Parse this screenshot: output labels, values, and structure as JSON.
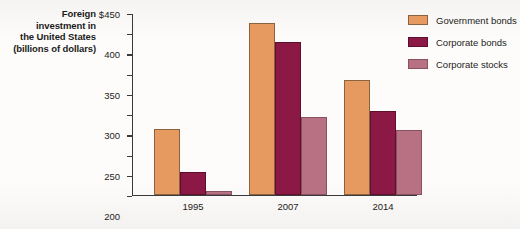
{
  "chart_data": {
    "type": "bar",
    "title": "Foreign investment in the United States (billions of dollars)",
    "title_lines": [
      "Foreign",
      "investment in",
      "the United States",
      "(billions of dollars)"
    ],
    "xlabel": "",
    "ylabel": "Foreign investment in the United States (billions of dollars)",
    "categories": [
      "1995",
      "2007",
      "2014"
    ],
    "series": [
      {
        "name": "Government bonds",
        "values": [
          163,
          425,
          283
        ],
        "color": "#e79a5f"
      },
      {
        "name": "Corporate bonds",
        "values": [
          57,
          378,
          207
        ],
        "color": "#8c1845"
      },
      {
        "name": "Corporate stocks",
        "values": [
          10,
          192,
          160
        ],
        "color": "#b87183"
      }
    ],
    "ylim": [
      0,
      450
    ],
    "ytick_values": [
      0,
      50,
      100,
      150,
      200,
      250,
      300,
      350,
      400,
      450
    ],
    "ytick_labels": [
      "0",
      "50",
      "100",
      "150",
      "200",
      "250",
      "300",
      "350",
      "400",
      "$450"
    ],
    "grid": false,
    "legend_position": "right"
  },
  "legend": {
    "items": [
      {
        "label": "Government bonds"
      },
      {
        "label": "Corporate bonds"
      },
      {
        "label": "Corporate stocks"
      }
    ]
  }
}
